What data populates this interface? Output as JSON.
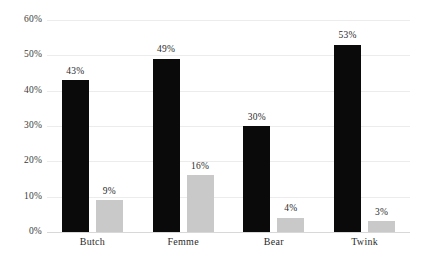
{
  "chart_data": {
    "type": "bar",
    "title": "",
    "subtitle": "",
    "xlabel": "",
    "ylabel": "",
    "categories": [
      "Butch",
      "Femme",
      "Bear",
      "Twink"
    ],
    "series": [
      {
        "name": "primary",
        "color": "#0a0a0a",
        "values": [
          43,
          49,
          30,
          53
        ],
        "labels": [
          "43%",
          "49%",
          "30%",
          "53%"
        ]
      },
      {
        "name": "secondary",
        "color": "#c9c9c9",
        "values": [
          9,
          16,
          4,
          3
        ],
        "labels": [
          "9%",
          "16%",
          "4%",
          "3%"
        ]
      }
    ],
    "ylim": [
      0,
      60
    ],
    "yticks": [
      0,
      10,
      20,
      30,
      40,
      50,
      60
    ],
    "ytick_labels": [
      "0%",
      "10%",
      "20%",
      "30%",
      "40%",
      "50%",
      "60%"
    ],
    "grid": true,
    "legend": "none"
  }
}
